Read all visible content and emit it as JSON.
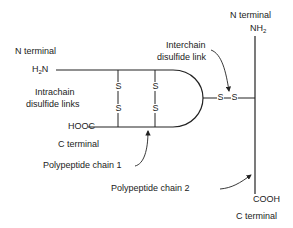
{
  "diagram": {
    "chain1": {
      "n_terminal_label": "N terminal",
      "n_group": "H",
      "n_group_sub": "2",
      "n_group_tail": "N",
      "c_group": "HOOC",
      "c_terminal_label": "C terminal",
      "name": "Polypeptide chain 1"
    },
    "chain2": {
      "n_terminal_label": "N terminal",
      "n_group": "NH",
      "n_group_sub": "2",
      "c_group": "COOH",
      "c_terminal_label": "C terminal",
      "name": "Polypeptide chain 2"
    },
    "intrachain_label_line1": "Intrachain",
    "intrachain_label_line2": "disulfide links",
    "interchain_label_line1": "Interchain",
    "interchain_label_line2": "disulfide link",
    "sulfur": "S",
    "line_color": "#222222"
  }
}
